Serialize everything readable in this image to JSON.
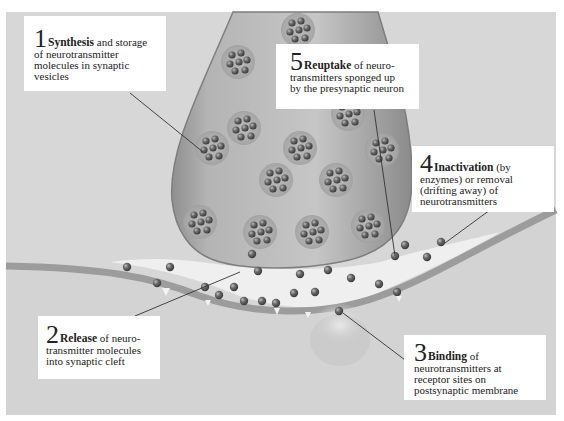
{
  "diagram": {
    "type": "synaptic transmission illustration",
    "colors": {
      "background_gray": "#d7d7d7",
      "neuron_terminal": "#a9a9a9",
      "cleft": "#ececec",
      "membrane": "#9c9c9c",
      "vesicle": "#b8b8b8",
      "neurotransmitter": "#5a5a5a",
      "label_background": "#ffffff",
      "text": "#222222"
    },
    "labels": [
      {
        "number": "1",
        "term": "Synthesis",
        "first_line_rest": " and storage",
        "lines": [
          "of neurotransmitter",
          "molecules in synaptic",
          "vesicles"
        ]
      },
      {
        "number": "2",
        "term": "Release",
        "first_line_rest": " of neuro-",
        "lines": [
          "transmitter molecules",
          "into synaptic cleft"
        ]
      },
      {
        "number": "3",
        "term": "Binding",
        "first_line_rest": " of",
        "lines": [
          "neurotransmitters at",
          "receptor sites on",
          "postsynaptic membrane"
        ]
      },
      {
        "number": "4",
        "term": "Inactivation",
        "first_line_rest": " (by",
        "lines": [
          "enzymes) or removal",
          "(drifting away) of",
          "neurotransmitters"
        ]
      },
      {
        "number": "5",
        "term": "Reuptake",
        "first_line_rest": " of neuro-",
        "lines": [
          "transmitters sponged up",
          "by the presynaptic neuron"
        ]
      }
    ]
  }
}
